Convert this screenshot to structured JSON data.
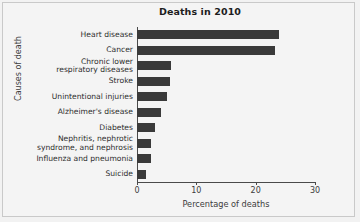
{
  "chart_data": {
    "type": "bar",
    "orientation": "horizontal",
    "title": "Deaths in 2010",
    "xlabel": "Percentage of deaths",
    "ylabel": "Causes of death",
    "xlim": [
      0,
      30
    ],
    "xticks": [
      0,
      10,
      20,
      30
    ],
    "xtick_labels": [
      "0",
      "10",
      "20",
      "30"
    ],
    "grid": false,
    "legend": null,
    "bar_color": "#3a3a3a",
    "categories": [
      "Heart disease",
      "Cancer",
      "Chronic lower\nrespiratory diseases",
      "Stroke",
      "Unintentional injuries",
      "Alzheimer's disease",
      "Diabetes",
      "Nephritis, nephrotic\nsyndrome, and nephrosis",
      "Influenza and pneumonia",
      "Suicide"
    ],
    "values": [
      23.9,
      23.2,
      5.7,
      5.5,
      5.0,
      4.0,
      3.0,
      2.4,
      2.3,
      1.6
    ]
  },
  "figure": {
    "background": "#f4f4f4",
    "axis_color": "#4a4a4a"
  }
}
